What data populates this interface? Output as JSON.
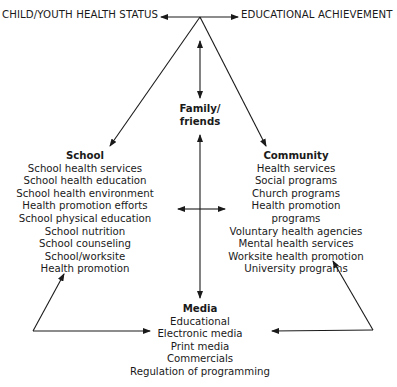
{
  "top": {
    "left_label": "CHILD/YOUTH HEALTH STATUS",
    "right_label": "EDUCATIONAL ACHIEVEMENT"
  },
  "family": {
    "line1": "Family/",
    "line2": "friends"
  },
  "school": {
    "title": "School",
    "items": [
      "School health services",
      "School health education",
      "School health environment",
      "Health promotion efforts",
      "School physical education",
      "School nutrition",
      "School counseling",
      "School/worksite",
      "Health promotion"
    ]
  },
  "community": {
    "title": "Community",
    "items": [
      "Health services",
      "Social programs",
      "Church programs",
      "Health promotion programs",
      "Voluntary health agencies",
      "Mental health services",
      "Worksite health promotion",
      "University programs"
    ]
  },
  "media": {
    "title": "Media",
    "items": [
      "Educational",
      "Electronic media",
      "Print media",
      "Commercials",
      "Regulation of programming"
    ]
  },
  "colors": {
    "line": "#1a1a1a",
    "background": "#ffffff"
  }
}
